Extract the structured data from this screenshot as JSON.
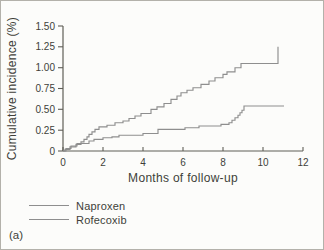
{
  "figure": {
    "panel_label": "(a)"
  },
  "chart_data": {
    "type": "line",
    "line_style": "step-after",
    "title": "",
    "xlabel": "Months of follow-up",
    "ylabel": "Cumulative incidence (%)",
    "xlim": [
      0,
      12
    ],
    "ylim": [
      0,
      1.5
    ],
    "grid": false,
    "legend_position": "below-left",
    "x_ticks": {
      "values": [
        0,
        2,
        4,
        6,
        8,
        10,
        12
      ],
      "labels": [
        "0",
        "2",
        "4",
        "6",
        "8",
        "10",
        "12"
      ]
    },
    "y_ticks": {
      "values": [
        0,
        0.25,
        0.5,
        0.75,
        1.0,
        1.25,
        1.5
      ],
      "labels": [
        "0",
        "0.25",
        "0.50",
        "0.75",
        "1.00",
        "1.25",
        "1.50"
      ]
    },
    "series": [
      {
        "name": "Naproxen",
        "color": "#8e8e8e",
        "end_x": 10.75,
        "points": [
          [
            0,
            0
          ],
          [
            0.1,
            0.02
          ],
          [
            0.35,
            0.05
          ],
          [
            0.65,
            0.08
          ],
          [
            0.9,
            0.11
          ],
          [
            1.05,
            0.14
          ],
          [
            1.2,
            0.17
          ],
          [
            1.3,
            0.2
          ],
          [
            1.45,
            0.23
          ],
          [
            1.6,
            0.26
          ],
          [
            1.8,
            0.29
          ],
          [
            2.2,
            0.31
          ],
          [
            2.6,
            0.34
          ],
          [
            3.0,
            0.36
          ],
          [
            3.3,
            0.39
          ],
          [
            3.6,
            0.42
          ],
          [
            3.9,
            0.45
          ],
          [
            4.4,
            0.5
          ],
          [
            4.7,
            0.53
          ],
          [
            5.05,
            0.57
          ],
          [
            5.4,
            0.62
          ],
          [
            5.7,
            0.66
          ],
          [
            5.9,
            0.7
          ],
          [
            6.2,
            0.73
          ],
          [
            6.5,
            0.76
          ],
          [
            6.9,
            0.8
          ],
          [
            7.3,
            0.84
          ],
          [
            7.6,
            0.88
          ],
          [
            8.0,
            0.92
          ],
          [
            8.2,
            0.95
          ],
          [
            8.6,
            1.0
          ],
          [
            8.9,
            1.05
          ],
          [
            10.75,
            1.25
          ]
        ]
      },
      {
        "name": "Rofecoxib",
        "color": "#8e8e8e",
        "end_x": 11.05,
        "points": [
          [
            0,
            0
          ],
          [
            0.15,
            0.03
          ],
          [
            0.4,
            0.06
          ],
          [
            0.7,
            0.09
          ],
          [
            1.3,
            0.12
          ],
          [
            1.55,
            0.14
          ],
          [
            2.0,
            0.16
          ],
          [
            2.45,
            0.17
          ],
          [
            2.8,
            0.19
          ],
          [
            4.0,
            0.21
          ],
          [
            4.75,
            0.26
          ],
          [
            6.1,
            0.28
          ],
          [
            6.8,
            0.3
          ],
          [
            7.9,
            0.32
          ],
          [
            8.3,
            0.34
          ],
          [
            8.45,
            0.37
          ],
          [
            8.6,
            0.4
          ],
          [
            8.75,
            0.43
          ],
          [
            8.85,
            0.46
          ],
          [
            8.95,
            0.49
          ],
          [
            9.05,
            0.54
          ]
        ]
      }
    ],
    "colors": {
      "axis": "#5f5e57",
      "text": "#403f39",
      "curve": "#8e8e8e",
      "border": "#b3b1aa",
      "background": "#fcfcfa"
    }
  }
}
